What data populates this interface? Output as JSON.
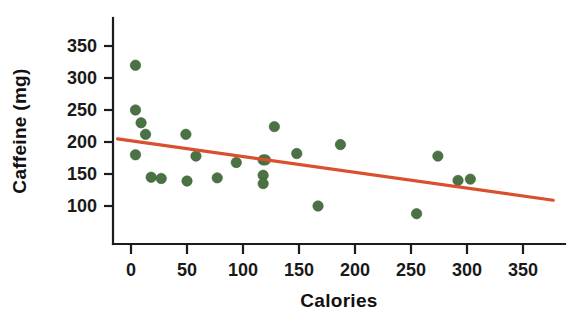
{
  "chart_data": {
    "type": "scatter",
    "title": "",
    "xlabel": "Calories",
    "ylabel": "Caffeine (mg)",
    "xlim": [
      -20,
      390
    ],
    "ylim": [
      55,
      375
    ],
    "grid": false,
    "legend": null,
    "xticks": [
      0,
      50,
      100,
      150,
      200,
      250,
      300,
      350
    ],
    "xtick_labels": [
      "0",
      "50",
      "100",
      "150",
      "200",
      "250",
      "300",
      "350"
    ],
    "yticks": [
      100,
      150,
      200,
      250,
      300,
      350
    ],
    "ytick_labels": [
      "100",
      "150",
      "200",
      "250",
      "300",
      "350"
    ],
    "point_color": "#4b7243",
    "trend_color": "#d9502e",
    "axis_color": "#1c1c1c",
    "points": [
      {
        "x": 4,
        "y": 320
      },
      {
        "x": 4,
        "y": 250
      },
      {
        "x": 9,
        "y": 230
      },
      {
        "x": 13,
        "y": 212
      },
      {
        "x": 4,
        "y": 180
      },
      {
        "x": 18,
        "y": 145
      },
      {
        "x": 27,
        "y": 143
      },
      {
        "x": 49,
        "y": 212
      },
      {
        "x": 50,
        "y": 139
      },
      {
        "x": 58,
        "y": 178
      },
      {
        "x": 77,
        "y": 144
      },
      {
        "x": 94,
        "y": 168
      },
      {
        "x": 118,
        "y": 172
      },
      {
        "x": 118,
        "y": 148
      },
      {
        "x": 118,
        "y": 135
      },
      {
        "x": 120,
        "y": 172
      },
      {
        "x": 128,
        "y": 224
      },
      {
        "x": 148,
        "y": 182
      },
      {
        "x": 167,
        "y": 100
      },
      {
        "x": 187,
        "y": 196
      },
      {
        "x": 255,
        "y": 88
      },
      {
        "x": 274,
        "y": 178
      },
      {
        "x": 292,
        "y": 140
      },
      {
        "x": 303,
        "y": 142
      }
    ],
    "trend": {
      "type": "linear",
      "x_start": -12,
      "y_start": 205,
      "x_end": 377,
      "y_end": 109
    }
  }
}
